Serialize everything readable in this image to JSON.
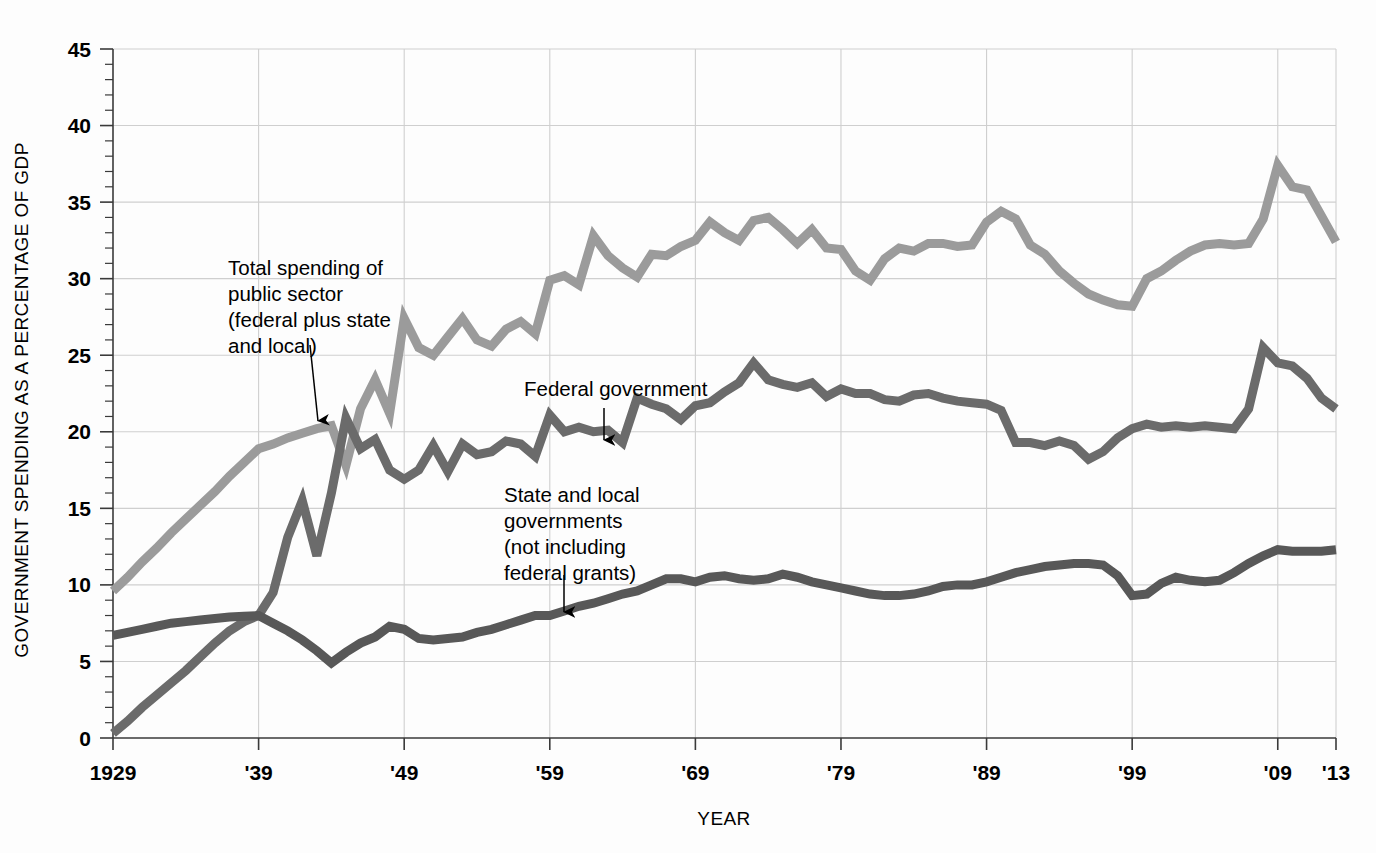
{
  "chart_data": {
    "type": "line",
    "title": "",
    "xlabel": "YEAR",
    "ylabel": "GOVERNMENT SPENDING AS A PERCENTAGE OF GDP",
    "xlim": [
      1929,
      2013
    ],
    "ylim": [
      0,
      45
    ],
    "ytick_values": [
      0,
      5,
      10,
      15,
      20,
      25,
      30,
      35,
      40,
      45
    ],
    "ytick_labels": [
      "0",
      "5",
      "10",
      "15",
      "20",
      "25",
      "30",
      "35",
      "40",
      "45"
    ],
    "y_minor_tick_step": 1,
    "xtick_values": [
      1929,
      1939,
      1949,
      1959,
      1969,
      1979,
      1989,
      1999,
      2009,
      2013
    ],
    "xtick_labels": [
      "1929",
      "'39",
      "'49",
      "'59",
      "'69",
      "'79",
      "'89",
      "'99",
      "'09",
      "'13"
    ],
    "grid": "both",
    "legend_position": "inline-annotations",
    "x": [
      1929,
      1930,
      1931,
      1932,
      1933,
      1934,
      1935,
      1936,
      1937,
      1938,
      1939,
      1940,
      1941,
      1942,
      1943,
      1944,
      1945,
      1946,
      1947,
      1948,
      1949,
      1950,
      1951,
      1952,
      1953,
      1954,
      1955,
      1956,
      1957,
      1958,
      1959,
      1960,
      1961,
      1962,
      1963,
      1964,
      1965,
      1966,
      1967,
      1968,
      1969,
      1970,
      1971,
      1972,
      1973,
      1974,
      1975,
      1976,
      1977,
      1978,
      1979,
      1980,
      1981,
      1982,
      1983,
      1984,
      1985,
      1986,
      1987,
      1988,
      1989,
      1990,
      1991,
      1992,
      1993,
      1994,
      1995,
      1996,
      1997,
      1998,
      1999,
      2000,
      2001,
      2002,
      2003,
      2004,
      2005,
      2006,
      2007,
      2008,
      2009,
      2010,
      2011,
      2012,
      2013
    ],
    "series": [
      {
        "name": "Total spending of public sector (federal plus state and local)",
        "color": "#9b9b9b",
        "linewidth": 9,
        "values": [
          9.6,
          10.5,
          11.5,
          12.4,
          13.4,
          14.3,
          15.2,
          16.1,
          17.1,
          18.0,
          18.9,
          19.2,
          19.6,
          19.9,
          20.2,
          20.4,
          17.8,
          21.5,
          23.4,
          21.2,
          27.4,
          25.5,
          25.0,
          26.2,
          27.4,
          26.0,
          25.6,
          26.7,
          27.2,
          26.4,
          29.9,
          30.2,
          29.6,
          32.8,
          31.5,
          30.7,
          30.1,
          31.6,
          31.5,
          32.1,
          32.5,
          33.7,
          33.0,
          32.5,
          33.8,
          34.0,
          33.2,
          32.3,
          33.2,
          32.0,
          31.9,
          30.5,
          29.9,
          31.3,
          32.0,
          31.8,
          32.3,
          32.3,
          32.1,
          32.2,
          33.7,
          34.4,
          33.9,
          32.2,
          31.6,
          30.5,
          29.7,
          29.0,
          28.6,
          28.3,
          28.2,
          30.0,
          30.5,
          31.2,
          31.8,
          32.2,
          32.3,
          32.2,
          32.3,
          33.9,
          37.4,
          36.0,
          35.8,
          34.1,
          32.4
        ]
      },
      {
        "name": "Federal government",
        "color": "#6b6b6b",
        "linewidth": 9,
        "values": [
          0.3,
          1.1,
          2.0,
          2.8,
          3.6,
          4.4,
          5.3,
          6.2,
          7.0,
          7.6,
          8.0,
          9.5,
          13.1,
          15.5,
          11.9,
          16.0,
          20.9,
          18.9,
          19.5,
          17.5,
          16.9,
          17.5,
          19.1,
          17.4,
          19.2,
          18.5,
          18.7,
          19.4,
          19.2,
          18.4,
          21.1,
          20.0,
          20.3,
          20.0,
          20.1,
          19.3,
          22.2,
          21.8,
          21.5,
          20.8,
          21.7,
          21.9,
          22.6,
          23.2,
          24.5,
          23.4,
          23.1,
          22.9,
          23.2,
          22.3,
          22.8,
          22.5,
          22.5,
          22.1,
          22.0,
          22.4,
          22.5,
          22.2,
          22.0,
          21.9,
          21.8,
          21.4,
          19.3,
          19.3,
          19.1,
          19.4,
          19.1,
          18.2,
          18.7,
          19.6,
          20.2,
          20.5,
          20.3,
          20.4,
          20.3,
          20.4,
          20.3,
          20.2,
          21.5,
          25.5,
          24.5,
          24.3,
          23.5,
          22.2,
          21.5
        ]
      },
      {
        "name": "State and local governments (not including federal grants)",
        "color": "#585858",
        "linewidth": 9,
        "values": [
          6.7,
          6.9,
          7.1,
          7.3,
          7.5,
          7.6,
          7.7,
          7.8,
          7.9,
          7.95,
          8.0,
          7.5,
          7.0,
          6.4,
          5.7,
          4.9,
          5.6,
          6.2,
          6.6,
          7.3,
          7.1,
          6.5,
          6.4,
          6.5,
          6.6,
          6.9,
          7.1,
          7.4,
          7.7,
          8.0,
          8.0,
          8.3,
          8.6,
          8.8,
          9.1,
          9.4,
          9.6,
          10.0,
          10.4,
          10.4,
          10.2,
          10.5,
          10.6,
          10.4,
          10.3,
          10.4,
          10.7,
          10.5,
          10.2,
          10.0,
          9.8,
          9.6,
          9.4,
          9.3,
          9.3,
          9.4,
          9.6,
          9.9,
          10.0,
          10.0,
          10.2,
          10.5,
          10.8,
          11.0,
          11.2,
          11.3,
          11.4,
          11.4,
          11.3,
          10.6,
          9.3,
          9.4,
          10.1,
          10.5,
          10.3,
          10.2,
          10.3,
          10.8,
          11.4,
          11.9,
          12.3,
          12.2,
          12.2,
          12.2,
          12.3
        ]
      }
    ],
    "annotations": [
      {
        "id": "total-annotation",
        "lines": [
          "Total spending of",
          "public sector",
          "(federal plus state",
          "and local)"
        ],
        "text_x": 228,
        "text_y": 275,
        "arrow": {
          "x1": 310,
          "y1": 345,
          "x2": 318,
          "y2": 421
        }
      },
      {
        "id": "federal-annotation",
        "lines": [
          "Federal government"
        ],
        "text_x": 524,
        "text_y": 396,
        "arrow": {
          "x1": 604,
          "y1": 408,
          "x2": 604,
          "y2": 440
        }
      },
      {
        "id": "state-local-annotation",
        "lines": [
          "State and local",
          "governments",
          "(not including",
          "federal grants)"
        ],
        "text_x": 504,
        "text_y": 502,
        "arrow": {
          "x1": 564,
          "y1": 575,
          "x2": 564,
          "y2": 612
        }
      }
    ]
  },
  "colors": {
    "background": "#fdfdfd",
    "grid": "#cfcfcf",
    "axis": "#3a3a3a",
    "total": "#9b9b9b",
    "federal": "#6b6b6b",
    "state_local": "#585858"
  }
}
